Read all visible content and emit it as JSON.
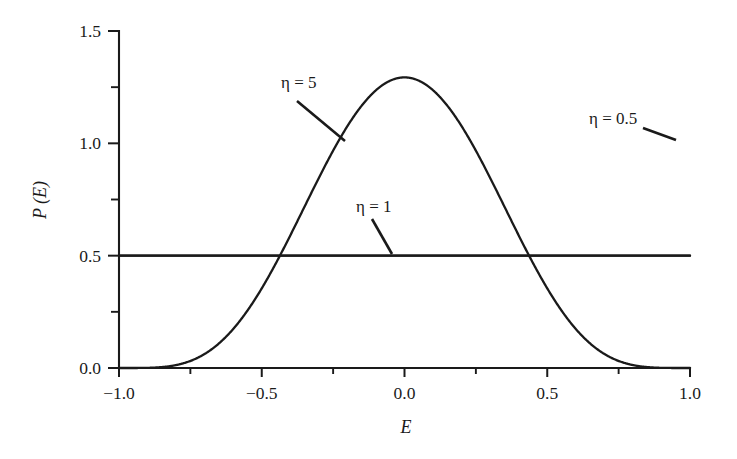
{
  "chart_data": {
    "type": "line",
    "title": "",
    "xlabel": "E",
    "ylabel": "P (E)",
    "xlim": [
      -1.0,
      1.0
    ],
    "ylim": [
      0.0,
      1.5
    ],
    "grid": false,
    "legend_position": "inline-annotations",
    "xticks": [
      -1.0,
      -0.5,
      0.0,
      0.5,
      1.0
    ],
    "xtick_labels": [
      "−1.0",
      "−0.5",
      "0.0",
      "0.5",
      "1.0"
    ],
    "xticks_minor": [
      -0.75,
      -0.25,
      0.25,
      0.75
    ],
    "yticks": [
      0.0,
      0.5,
      1.0,
      1.5
    ],
    "ytick_labels": [
      "0.0",
      "0.5",
      "1.0",
      "1.5"
    ],
    "yticks_minor": [
      0.25,
      0.75,
      1.25
    ],
    "annotations": [
      {
        "text": "η = 5",
        "x": -0.45,
        "y": 1.27
      },
      {
        "text": "η = 1",
        "x": 0.06,
        "y": 0.8
      },
      {
        "text": "η = 0.5",
        "x": 0.73,
        "y": 1.12
      }
    ],
    "series": [
      {
        "name": "η = 5",
        "eta": 5,
        "x": [
          -1.0,
          -0.95,
          -0.9,
          -0.85,
          -0.8,
          -0.75,
          -0.7,
          -0.65,
          -0.6,
          -0.55,
          -0.5,
          -0.45,
          -0.4,
          -0.35,
          -0.3,
          -0.25,
          -0.2,
          -0.15,
          -0.1,
          -0.05,
          0.0,
          0.05,
          0.1,
          0.15,
          0.2,
          0.25,
          0.3,
          0.35,
          0.4,
          0.45,
          0.5,
          0.55,
          0.6,
          0.65,
          0.7,
          0.75,
          0.8,
          0.85,
          0.9,
          0.95,
          1.0
        ],
        "values": [
          0.0,
          0.004,
          0.014,
          0.031,
          0.054,
          0.082,
          0.115,
          0.153,
          0.196,
          0.242,
          0.292,
          0.345,
          0.4,
          0.457,
          0.516,
          0.575,
          0.634,
          0.693,
          0.75,
          0.805,
          0.858,
          0.907,
          0.952,
          0.993,
          1.029,
          1.06,
          1.086,
          1.106,
          1.12,
          1.129,
          1.132,
          1.129,
          1.12,
          1.106,
          1.086,
          1.06,
          1.029,
          0.993,
          0.952,
          0.907,
          0.858
        ]
      },
      {
        "name": "η = 1",
        "eta": 1,
        "x": [
          -1.0,
          1.0
        ],
        "values": [
          0.5,
          0.5
        ]
      },
      {
        "name": "η = 0.5",
        "eta": 0.5,
        "x": [
          -1.0,
          -0.9,
          -0.8,
          -0.7,
          -0.6,
          -0.5,
          -0.4,
          -0.3,
          -0.2,
          -0.1,
          0.0,
          0.1,
          0.2,
          0.3,
          0.4,
          0.5,
          0.6,
          0.7,
          0.8,
          0.9,
          1.0
        ],
        "values": [
          1.5,
          0.73,
          0.53,
          0.445,
          0.398,
          0.367,
          0.347,
          0.334,
          0.325,
          0.319,
          0.318,
          0.319,
          0.325,
          0.334,
          0.347,
          0.367,
          0.398,
          0.445,
          0.53,
          0.73,
          1.5
        ]
      }
    ],
    "curve_description": "Energy distribution P(E) on [-1,1] for shape parameter eta: eta=5 is a broad single peak with maximum ~1.22 at E=0 falling to 0 at E=±1; eta=1 is the uniform value 0.5; eta=0.5 is U-shaped with minimum ~0.31 at E=0 and diverging toward E=±1."
  },
  "colors": {
    "ink": "#1a1a1a",
    "background": "#ffffff"
  }
}
